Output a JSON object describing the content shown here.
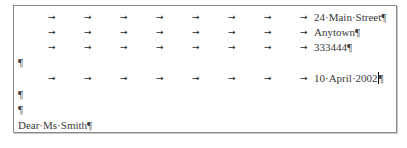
{
  "document": {
    "tab_marker": "→",
    "paragraph_marker": "¶",
    "tab_positions_px": [
      34,
      70,
      106,
      142,
      178,
      214,
      250,
      286
    ],
    "text_indent_px": 300,
    "lines": [
      {
        "tabs": 8,
        "text": "24·Main·Street",
        "mark": "¶"
      },
      {
        "tabs": 8,
        "text": "Anytown",
        "mark": "¶"
      },
      {
        "tabs": 8,
        "text": "333444",
        "mark": "¶"
      },
      {
        "tabs": 0,
        "text": "",
        "mark": "¶"
      },
      {
        "tabs": 8,
        "text": "10·April·2002",
        "mark": "¶",
        "cursor": true
      },
      {
        "tabs": 0,
        "text": "",
        "mark": "¶"
      },
      {
        "tabs": 0,
        "text": "",
        "mark": "¶"
      },
      {
        "tabs": 0,
        "text": "Dear·Ms·Smith",
        "mark": "¶"
      }
    ]
  },
  "address": {
    "street": "24·Main·Street",
    "town": "Anytown",
    "postcode": "333444"
  },
  "date": "10·April·2002",
  "salutation": "Dear·Ms·Smith"
}
